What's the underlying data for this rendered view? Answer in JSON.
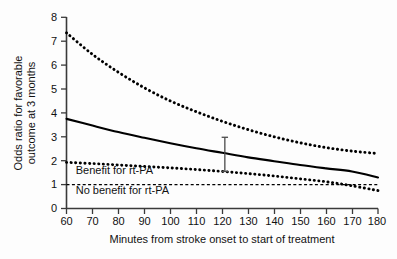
{
  "chart_data": {
    "type": "line",
    "title": "",
    "subtitle": "",
    "xlabel": "Minutes from stroke onset to start of treatment",
    "ylabel": "Odds ratio for favorable outcome at 3 months",
    "xlim": [
      60,
      180
    ],
    "ylim": [
      0,
      8
    ],
    "xticks": [
      60,
      70,
      80,
      90,
      100,
      110,
      120,
      130,
      140,
      150,
      160,
      170,
      180
    ],
    "yticks": [
      0,
      1,
      2,
      3,
      4,
      5,
      6,
      7,
      8
    ],
    "grid": false,
    "legend_position": "none",
    "x": [
      60,
      70,
      80,
      90,
      100,
      110,
      120,
      130,
      140,
      150,
      160,
      170,
      180
    ],
    "series": [
      {
        "name": "Upper 95% confidence limit",
        "style": "dotted",
        "values": [
          7.35,
          6.45,
          5.7,
          5.05,
          4.5,
          4.05,
          3.65,
          3.3,
          3.0,
          2.75,
          2.55,
          2.4,
          2.3
        ]
      },
      {
        "name": "Adjusted odds ratio",
        "style": "solid",
        "values": [
          3.75,
          3.47,
          3.2,
          2.96,
          2.73,
          2.52,
          2.33,
          2.14,
          1.98,
          1.82,
          1.68,
          1.55,
          1.3
        ]
      },
      {
        "name": "Lower 95% confidence limit",
        "style": "dotted",
        "values": [
          1.93,
          1.88,
          1.82,
          1.76,
          1.7,
          1.63,
          1.55,
          1.46,
          1.36,
          1.24,
          1.12,
          0.95,
          0.75
        ]
      }
    ],
    "reference_lines": [
      {
        "name": "No benefit line",
        "y": 1.0,
        "style": "dashed"
      }
    ],
    "error_bars": [
      {
        "x": 121,
        "low": 1.55,
        "high": 2.98
      }
    ],
    "annotations": [
      {
        "name": "benefit-label",
        "text": "Benefit for rt-PA",
        "x": 62,
        "y": 1.45
      },
      {
        "name": "no-benefit-label",
        "text": "No benefit for rt-PA",
        "x": 62,
        "y": 0.62
      }
    ],
    "colors": {
      "curve": "#000000",
      "axis": "#3a3a3a",
      "text": "#111111",
      "background": "#fdfdfd"
    }
  },
  "axes": {
    "x_tick_labels": [
      "60",
      "70",
      "80",
      "90",
      "100",
      "110",
      "120",
      "130",
      "140",
      "150",
      "160",
      "170",
      "180"
    ],
    "y_tick_labels": [
      "0",
      "1",
      "2",
      "3",
      "4",
      "5",
      "6",
      "7",
      "8"
    ],
    "x_title": "Minutes from stroke onset to start of treatment",
    "y_title_line1": "Odds ratio for favorable",
    "y_title_line2": "outcome at 3 months"
  },
  "annotations": {
    "benefit": "Benefit for rt-PA",
    "no_benefit": "No benefit for rt-PA"
  }
}
